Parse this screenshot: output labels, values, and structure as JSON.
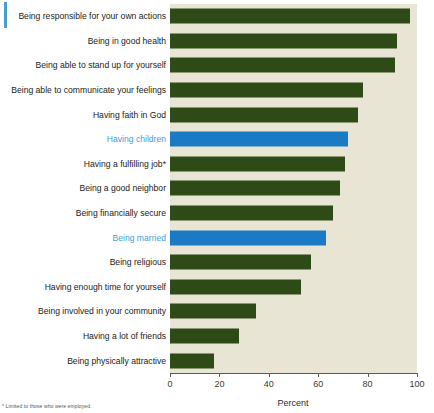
{
  "chart_data": {
    "type": "bar",
    "orientation": "horizontal",
    "title": "",
    "xlabel": "Percent",
    "ylabel": "",
    "xlim": [
      0,
      100
    ],
    "xticks": [
      0,
      20,
      40,
      60,
      80,
      100
    ],
    "xtick_labels": [
      "0",
      "20",
      "40",
      "60",
      "80",
      "100"
    ],
    "grid": false,
    "legend": "none",
    "categories": [
      "Being responsible for your own actions",
      "Being in good health",
      "Being able to stand up for yourself",
      "Being able to communicate your feelings",
      "Having faith in God",
      "Having children",
      "Having a fulfilling job*",
      "Being a good neighbor",
      "Being financially secure",
      "Being married",
      "Being religious",
      "Having enough time for yourself",
      "Being involved in your community",
      "Having a lot of friends",
      "Being physically attractive"
    ],
    "values": [
      97,
      92,
      91,
      78,
      76,
      72,
      71,
      69,
      66,
      63,
      57,
      53,
      35,
      28,
      18
    ],
    "highlighted": [
      "Having children",
      "Being married"
    ],
    "colors": {
      "bar": "#2e4a17",
      "bar_highlight": "#1b7ac4",
      "plot_background": "#e9e5d4",
      "label": "#1b1b18",
      "label_highlight": "#4a9ad4",
      "axis": "#5b5b50",
      "accent": "#4a9ad4"
    }
  },
  "axis": {
    "x_title": "Percent",
    "ticks": [
      "0",
      "20",
      "40",
      "60",
      "80",
      "100"
    ]
  },
  "footnote": {
    "text": "* Limited to those who were employed."
  }
}
